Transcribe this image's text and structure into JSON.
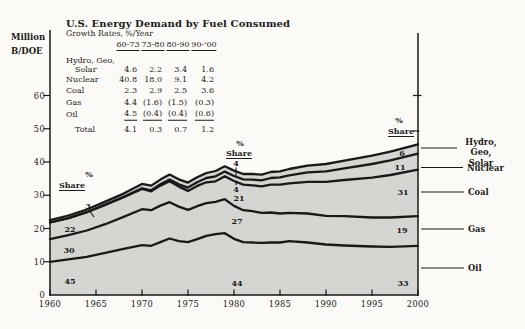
{
  "title": "U.S. Energy Demand by Fuel Consumed",
  "subtitle": "Growth Rates, %/Year",
  "y_axis": {
    "label_line1": "Million",
    "label_line2": "B/DOE",
    "ticks": [
      "0",
      "10",
      "20",
      "30",
      "40",
      "50",
      "60"
    ]
  },
  "x_axis": {
    "ticks": [
      "1960",
      "1965",
      "1970",
      "1975",
      "1980",
      "1985",
      "1990",
      "1995",
      "2000"
    ]
  },
  "growth_table": {
    "col_headers": [
      "60-73",
      "73-80",
      "80-90",
      "90-'00"
    ],
    "rows": [
      {
        "label": "Hydro, Geo,",
        "label2": "Solar",
        "values": [
          "4.6",
          "2.2",
          "3.4",
          "1.6"
        ]
      },
      {
        "label": "Nuclear",
        "values": [
          "40.8",
          "18.0",
          "9.1",
          "4.2"
        ]
      },
      {
        "label": "Coal",
        "values": [
          "2.3",
          "2.9",
          "2.5",
          "3.6"
        ]
      },
      {
        "label": "Gas",
        "values": [
          "4.4",
          "(1.6)",
          "(1.5)",
          "(0.3)"
        ]
      },
      {
        "label": "Oil",
        "values": [
          "4.5",
          "(0.4)",
          "(0.4)",
          "(0.6)"
        ],
        "underline": true
      },
      {
        "label": "Total",
        "values": [
          "4.1",
          "0.3",
          "0.7",
          "1.2"
        ],
        "indent": true
      }
    ]
  },
  "share_columns": [
    {
      "year": "1960",
      "percent_label": "%",
      "share_label": "Share",
      "values": [
        "3",
        "22",
        "30",
        "45"
      ]
    },
    {
      "year": "1980",
      "percent_label": "%",
      "share_label": "Share",
      "values": [
        "4",
        "4",
        "21",
        "27",
        "44"
      ]
    },
    {
      "year": "2000",
      "percent_label": "%",
      "share_label": "Share",
      "values": [
        "6",
        "11",
        "31",
        "19",
        "33"
      ]
    }
  ],
  "legend_items": [
    {
      "label": "Hydro, Geo, Solar",
      "lines": [
        "Hydro,",
        "Geo, Solar"
      ]
    },
    {
      "label": "Nuclear",
      "lines": [
        "Nuclear"
      ]
    },
    {
      "label": "Coal",
      "lines": [
        "Coal"
      ]
    },
    {
      "label": "Gas",
      "lines": [
        "Gas"
      ]
    },
    {
      "label": "Oil",
      "lines": [
        "Oil"
      ]
    }
  ],
  "colors": {
    "area_fill": "#d5d5d1",
    "line_ink": "#191917",
    "background": "#fbfaf6"
  },
  "chart_data": {
    "type": "area",
    "stacked": true,
    "title": "U.S. Energy Demand by Fuel Consumed",
    "ylabel": "Million B/DOE",
    "xlim": [
      1960,
      2000
    ],
    "ylim": [
      0,
      60
    ],
    "grid": false,
    "legend_position": "right",
    "x": [
      1960,
      1962,
      1964,
      1966,
      1968,
      1970,
      1971,
      1972,
      1973,
      1974,
      1975,
      1976,
      1977,
      1978,
      1979,
      1980,
      1981,
      1982,
      1983,
      1984,
      1985,
      1986,
      1988,
      1990,
      1992,
      1995,
      1997,
      2000
    ],
    "series": [
      {
        "name": "Oil",
        "values": [
          10.0,
          10.7,
          11.5,
          12.7,
          13.9,
          15.0,
          14.8,
          15.9,
          17.0,
          16.2,
          15.9,
          16.8,
          17.8,
          18.3,
          18.6,
          16.9,
          15.9,
          15.8,
          15.7,
          15.8,
          15.8,
          16.2,
          15.8,
          15.2,
          14.9,
          14.6,
          14.5,
          14.8
        ]
      },
      {
        "name": "Gas",
        "values": [
          6.8,
          7.3,
          7.9,
          8.6,
          9.6,
          10.8,
          10.7,
          11.0,
          10.9,
          10.4,
          9.7,
          9.9,
          9.8,
          9.7,
          10.2,
          9.9,
          9.6,
          9.4,
          9.0,
          9.0,
          8.7,
          8.5,
          8.7,
          8.6,
          8.8,
          8.7,
          8.8,
          8.9
        ]
      },
      {
        "name": "Coal",
        "values": [
          5.0,
          5.1,
          5.5,
          5.8,
          5.9,
          6.1,
          5.7,
          6.0,
          6.3,
          6.0,
          5.7,
          6.1,
          6.3,
          6.2,
          6.9,
          7.5,
          7.7,
          7.8,
          8.0,
          8.4,
          8.7,
          8.9,
          9.5,
          10.2,
          10.9,
          12.0,
          12.8,
          14.0
        ]
      },
      {
        "name": "Nuclear",
        "values": [
          0.0,
          0.0,
          0.0,
          0.1,
          0.1,
          0.2,
          0.3,
          0.4,
          0.5,
          0.7,
          1.0,
          1.1,
          1.3,
          1.5,
          1.4,
          1.5,
          1.6,
          1.7,
          1.8,
          2.0,
          2.2,
          2.4,
          2.9,
          3.2,
          3.5,
          4.1,
          4.4,
          4.8
        ]
      },
      {
        "name": "Hydro, Geo, Solar",
        "values": [
          0.7,
          0.8,
          0.8,
          0.9,
          1.0,
          1.3,
          1.4,
          1.4,
          1.5,
          1.5,
          1.5,
          1.5,
          1.5,
          1.6,
          1.6,
          1.6,
          1.6,
          1.7,
          1.7,
          1.8,
          1.8,
          1.9,
          2.0,
          2.2,
          2.3,
          2.5,
          2.6,
          2.8
        ]
      }
    ],
    "percent_shares": {
      "1960": {
        "Hydro, Geo, Solar": 3,
        "Coal": 22,
        "Gas": 30,
        "Oil": 45
      },
      "1980": {
        "Hydro, Geo, Solar": 4,
        "Nuclear": 4,
        "Coal": 21,
        "Gas": 27,
        "Oil": 44
      },
      "2000": {
        "Hydro, Geo, Solar": 6,
        "Nuclear": 11,
        "Coal": 31,
        "Gas": 19,
        "Oil": 33
      }
    },
    "growth_rates_pct_per_year": {
      "periods": [
        "60-73",
        "73-80",
        "80-90",
        "90-'00"
      ],
      "Hydro, Geo, Solar": [
        4.6,
        2.2,
        3.4,
        1.6
      ],
      "Nuclear": [
        40.8,
        18.0,
        9.1,
        4.2
      ],
      "Coal": [
        2.3,
        2.9,
        2.5,
        3.6
      ],
      "Gas": [
        4.4,
        -1.6,
        -1.5,
        -0.3
      ],
      "Oil": [
        4.5,
        -0.4,
        -0.4,
        -0.6
      ],
      "Total": [
        4.1,
        0.3,
        0.7,
        1.2
      ]
    }
  }
}
